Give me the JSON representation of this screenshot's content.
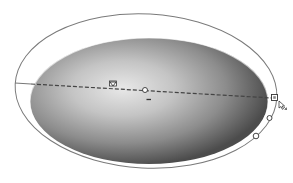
{
  "canvas": {
    "width": 293,
    "height": 183,
    "background": "#ffffff"
  },
  "gradient_object": {
    "shape": "ellipse",
    "type": "radial",
    "center": [
      146,
      100
    ],
    "rx": 119,
    "ry": 63,
    "highlight_center": [
      118,
      88
    ],
    "stops": [
      {
        "offset": 0,
        "color": "#e6e6e6"
      },
      {
        "offset": 0.55,
        "color": "#9a9a9a"
      },
      {
        "offset": 1,
        "color": "#4a4a4a"
      }
    ]
  },
  "gradient_annotator": {
    "outer_ring": {
      "center": [
        146,
        91
      ],
      "rx": 131,
      "ry": 77,
      "rotation": 3,
      "stroke": "#7a7a7a"
    },
    "gradient_bar": {
      "start": [
        15,
        83
      ],
      "end": [
        275,
        98
      ],
      "style": "dashed",
      "stroke": "#555555"
    },
    "origin_handle": {
      "position": [
        145,
        90
      ],
      "shape": "circle"
    },
    "color_stop_marker": {
      "position": [
        113,
        85
      ],
      "shape": "triangle"
    },
    "end_handle": {
      "position": [
        275,
        98
      ],
      "shape": "square"
    },
    "aspect_handle": {
      "position": [
        269,
        118
      ],
      "shape": "circle"
    },
    "rotate_handle": {
      "position": [
        256,
        136
      ],
      "shape": "circle"
    },
    "midpoint_tick": {
      "position": [
        149,
        99
      ]
    },
    "cursor": {
      "position": [
        281,
        102
      ],
      "type": "resize-arrow-cursor"
    }
  }
}
